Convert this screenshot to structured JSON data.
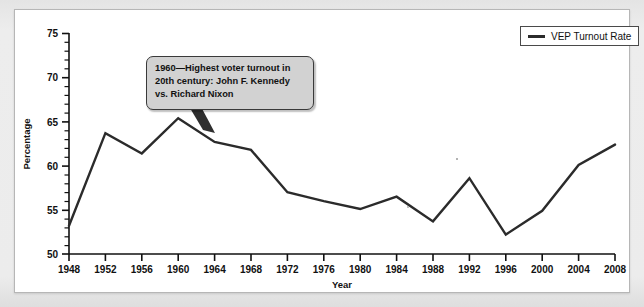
{
  "figure": {
    "panel_background": "#ffffff",
    "page_background": "#e9e9e9",
    "line_color": "#2b2b2b",
    "axis_color": "#111111"
  },
  "legend": {
    "label": "VEP Turnout Rate",
    "swatch_color": "#2b2b2b",
    "position": "top-right"
  },
  "annotation": {
    "text": "1960—Highest voter turnout in 20th century: John F. Kennedy vs. Richard Nixon",
    "line1": "1960—Highest voter turnout in",
    "line2": "20th century: John F. Kennedy",
    "line3": "vs. Richard Nixon",
    "points_to_year": 1960,
    "background": "#d2d2d2",
    "border": "#3a3a3a"
  },
  "chart_data": {
    "type": "line",
    "title": "",
    "xlabel": "Year",
    "ylabel": "Percentage",
    "xlim": [
      1948,
      2008
    ],
    "ylim": [
      50,
      75
    ],
    "ytick_step": 5,
    "yminor_step": 1,
    "xtick_step": 4,
    "grid": false,
    "legend_position": "top-right",
    "categories": [
      1948,
      1952,
      1956,
      1960,
      1964,
      1968,
      1972,
      1976,
      1980,
      1984,
      1988,
      1992,
      1996,
      2000,
      2004,
      2008
    ],
    "xtick_labels": [
      "1948",
      "1952",
      "1956",
      "1960",
      "1964",
      "1968",
      "1972",
      "1976",
      "1980",
      "1984",
      "1988",
      "1992",
      "1996",
      "2000",
      "2004",
      "2008"
    ],
    "ytick_labels": [
      "50",
      "55",
      "60",
      "65",
      "70",
      "75"
    ],
    "ytick_values": [
      50,
      55,
      60,
      65,
      70,
      75
    ],
    "series": [
      {
        "name": "VEP Turnout Rate",
        "color": "#2b2b2b",
        "values": [
          53.2,
          63.7,
          61.4,
          65.4,
          62.7,
          61.8,
          57.0,
          56.0,
          55.1,
          56.5,
          53.7,
          58.6,
          52.2,
          54.9,
          60.1,
          62.4
        ]
      }
    ]
  }
}
